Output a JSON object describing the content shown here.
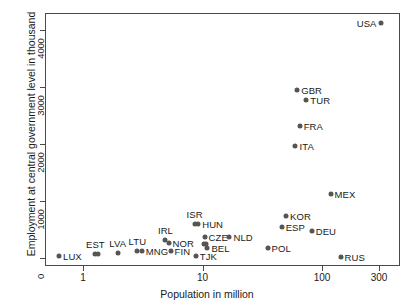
{
  "chart_data": {
    "type": "scatter",
    "title": "",
    "xlabel": "Population in million",
    "ylabel": "Employment at central government level in thousand",
    "xscale": "log",
    "yscale": "linear",
    "xlim": [
      0.55,
      330
    ],
    "ylim": [
      -100,
      4200
    ],
    "xticks": [
      1,
      10,
      100,
      300
    ],
    "xticklabels": [
      "1",
      "10",
      "100",
      "300"
    ],
    "yticks": [
      0,
      1000,
      2000,
      3000,
      4000
    ],
    "yticklabels": [
      "0",
      "1000",
      "2000",
      "3000",
      "4000"
    ],
    "grid": false,
    "legend": false,
    "marker_color": "#555555",
    "frame_color": "#4a4a4a",
    "points": [
      {
        "label": "LUX",
        "x": 0.63,
        "y": 40,
        "label_pos": "right"
      },
      {
        "label": "EST",
        "x": 1.27,
        "y": 70,
        "label_pos": "above"
      },
      {
        "label": "",
        "x": 1.33,
        "y": 70,
        "label_pos": "none"
      },
      {
        "label": "LVA",
        "x": 1.95,
        "y": 90,
        "label_pos": "above"
      },
      {
        "label": "LTU",
        "x": 2.85,
        "y": 130,
        "label_pos": "above"
      },
      {
        "label": "MNG",
        "x": 3.1,
        "y": 120,
        "label_pos": "right"
      },
      {
        "label": "IRL",
        "x": 4.9,
        "y": 320,
        "label_pos": "above"
      },
      {
        "label": "NOR",
        "x": 5.2,
        "y": 270,
        "label_pos": "right"
      },
      {
        "label": "FIN",
        "x": 5.4,
        "y": 130,
        "label_pos": "right"
      },
      {
        "label": "ISR",
        "x": 8.6,
        "y": 600,
        "label_pos": "above"
      },
      {
        "label": "HUN",
        "x": 9.2,
        "y": 590,
        "label_pos": "right"
      },
      {
        "label": "TJK",
        "x": 8.8,
        "y": 40,
        "label_pos": "right"
      },
      {
        "label": "CZE",
        "x": 10.4,
        "y": 370,
        "label_pos": "right"
      },
      {
        "label": "",
        "x": 10.3,
        "y": 250,
        "label_pos": "none"
      },
      {
        "label": "",
        "x": 10.7,
        "y": 240,
        "label_pos": "none"
      },
      {
        "label": "BEL",
        "x": 11.0,
        "y": 170,
        "label_pos": "right"
      },
      {
        "label": "NLD",
        "x": 16.8,
        "y": 370,
        "label_pos": "right"
      },
      {
        "label": "POL",
        "x": 35.0,
        "y": 170,
        "label_pos": "right"
      },
      {
        "label": "ESP",
        "x": 46.0,
        "y": 540,
        "label_pos": "right"
      },
      {
        "label": "KOR",
        "x": 50.0,
        "y": 740,
        "label_pos": "right"
      },
      {
        "label": "ITA",
        "x": 60.0,
        "y": 1960,
        "label_pos": "right"
      },
      {
        "label": "GBR",
        "x": 62.0,
        "y": 2950,
        "label_pos": "right"
      },
      {
        "label": "FRA",
        "x": 65.0,
        "y": 2320,
        "label_pos": "right"
      },
      {
        "label": "TUR",
        "x": 74.0,
        "y": 2780,
        "label_pos": "right"
      },
      {
        "label": "DEU",
        "x": 82.0,
        "y": 470,
        "label_pos": "right"
      },
      {
        "label": "MEX",
        "x": 118.0,
        "y": 1130,
        "label_pos": "right"
      },
      {
        "label": "RUS",
        "x": 143.0,
        "y": 20,
        "label_pos": "right"
      },
      {
        "label": "USA",
        "x": 309.0,
        "y": 4120,
        "label_pos": "left"
      }
    ]
  }
}
